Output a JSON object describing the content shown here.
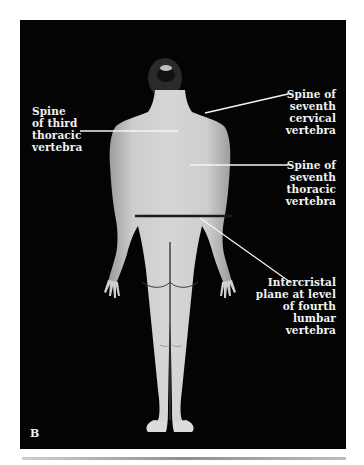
{
  "figure": {
    "panel_letter": "B",
    "view": "posterior view of standing female figure",
    "colors": {
      "background": "#040404",
      "label_text": "#f2f2f2",
      "leader_line": "#f4f4f4",
      "intercristal_line": "#1a1a1a",
      "skin": "#c8c8c8"
    },
    "labels": {
      "third_thoracic": {
        "lines": [
          "Spine",
          "of third",
          "thoracic",
          "vertebra"
        ]
      },
      "seventh_cervical": {
        "lines": [
          "Spine of",
          "seventh",
          "cervical",
          "vertebra"
        ]
      },
      "seventh_thoracic": {
        "lines": [
          "Spine of",
          "seventh",
          "thoracic",
          "vertebra"
        ]
      },
      "intercristal": {
        "lines": [
          "Intercristal",
          "plane at level",
          "of fourth",
          "lumbar",
          "vertebra"
        ]
      }
    }
  }
}
